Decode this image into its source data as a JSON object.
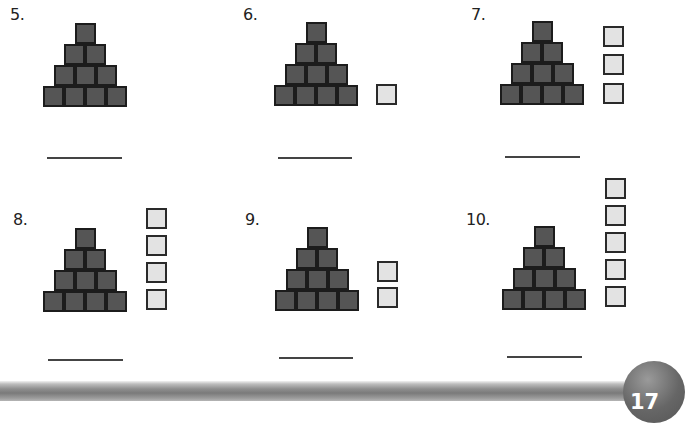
{
  "page_number": "17",
  "problems": [
    {
      "label": "5.",
      "pyramid_blocks": 10,
      "extra_blocks": 0
    },
    {
      "label": "6.",
      "pyramid_blocks": 10,
      "extra_blocks": 1
    },
    {
      "label": "7.",
      "pyramid_blocks": 10,
      "extra_blocks": 3
    },
    {
      "label": "8.",
      "pyramid_blocks": 10,
      "extra_blocks": 4
    },
    {
      "label": "9.",
      "pyramid_blocks": 10,
      "extra_blocks": 2
    },
    {
      "label": "10.",
      "pyramid_blocks": 10,
      "extra_blocks": 5
    }
  ],
  "colors": {
    "pyramid_block": "#555555",
    "extra_block": "#e3e3e3",
    "border": "#1c1c1c"
  }
}
